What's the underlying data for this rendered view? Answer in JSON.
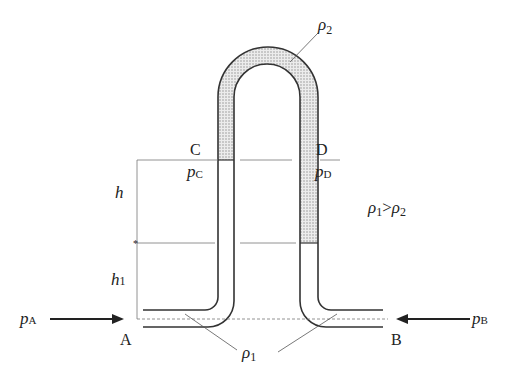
{
  "diagram": {
    "type": "inverted-U-tube-manometer",
    "colors": {
      "line": "#333333",
      "thin_line": "#666666",
      "fill_rho2": "#d9d9d9",
      "background": "#ffffff"
    },
    "labels": {
      "rho2_top": "ρ",
      "rho2_top_sub": "2",
      "point_c": "C",
      "point_d": "D",
      "pc": "p",
      "pc_sub": "C",
      "pd": "p",
      "pd_sub": "D",
      "h": "h",
      "h1": "h",
      "h1_sub": "1",
      "relation_rho1": "ρ",
      "relation_rho1_sub": "1",
      "relation_op": ">",
      "relation_rho2": "ρ",
      "relation_rho2_sub": "2",
      "pa": "p",
      "pa_sub": "A",
      "pb": "p",
      "pb_sub": "B",
      "point_a": "A",
      "point_b": "B",
      "rho1_bottom": "ρ",
      "rho1_bottom_sub": "1"
    }
  }
}
